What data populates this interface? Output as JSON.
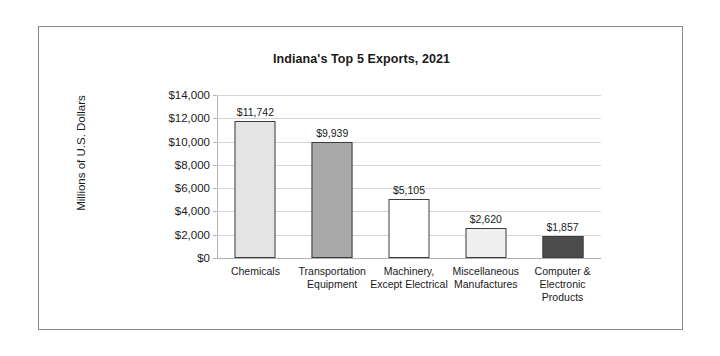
{
  "chart_data": {
    "type": "bar",
    "title": "Indiana's Top 5 Exports, 2021",
    "xlabel": "",
    "ylabel": "Millions of U.S. Dollars",
    "ylim": [
      0,
      14000
    ],
    "grid": true,
    "legend": "none",
    "categories": [
      "Chemicals",
      "Transportation Equipment",
      "Machinery, Except Electrical",
      "Miscellaneous Manufactures",
      "Computer & Electronic Products"
    ],
    "values": [
      11742,
      9939,
      5105,
      2620,
      1857
    ],
    "data_labels": [
      "$11,742",
      "$9,939",
      "$5,105",
      "$2,620",
      "$1,857"
    ],
    "bar_colors": [
      "#e4e4e4",
      "#a9a9a9",
      "#ffffff",
      "#efefef",
      "#4c4c4c"
    ],
    "bar_border_color": "#3d3d3d",
    "ticks": [
      {
        "value": 14000,
        "label": "$14,000"
      },
      {
        "value": 12000,
        "label": "$12,000"
      },
      {
        "value": 10000,
        "label": "$10,000"
      },
      {
        "value": 8000,
        "label": "$8,000"
      },
      {
        "value": 6000,
        "label": "$6,000"
      },
      {
        "value": 4000,
        "label": "$4,000"
      },
      {
        "value": 2000,
        "label": "$2,000"
      },
      {
        "value": 0,
        "label": "$0"
      }
    ]
  }
}
